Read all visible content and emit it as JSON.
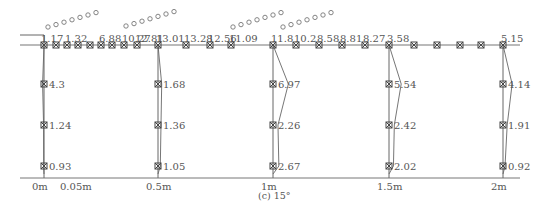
{
  "caption": "(c) 15°",
  "x_axis": {
    "ticks": [
      {
        "label": "0m",
        "x": 44
      },
      {
        "label": "0.05m",
        "x": 72
      },
      {
        "label": "0.5m",
        "x": 158
      },
      {
        "label": "1m",
        "x": 273
      },
      {
        "label": "1.5m",
        "x": 389
      },
      {
        "label": "2m",
        "x": 503
      }
    ]
  },
  "bed_line_y": 45,
  "baseline_y": 178,
  "surface_points": [
    {
      "x": 44,
      "label": "1.17"
    },
    {
      "x": 56,
      "label": ""
    },
    {
      "x": 67,
      "label": "1.32"
    },
    {
      "x": 78,
      "label": ""
    },
    {
      "x": 90,
      "label": ""
    },
    {
      "x": 101,
      "label": "6.88"
    },
    {
      "x": 112,
      "label": ""
    },
    {
      "x": 124,
      "label": "10.27"
    },
    {
      "x": 137,
      "label": "12.81"
    },
    {
      "x": 158,
      "label": "13.01"
    },
    {
      "x": 186,
      "label": "13.28"
    },
    {
      "x": 210,
      "label": "12.56"
    },
    {
      "x": 231,
      "label": "11.09"
    },
    {
      "x": 273,
      "label": "11.8"
    },
    {
      "x": 296,
      "label": "10.2"
    },
    {
      "x": 319,
      "label": "8.58"
    },
    {
      "x": 342,
      "label": "8.81"
    },
    {
      "x": 365,
      "label": "8.27"
    },
    {
      "x": 389,
      "label": "3.58"
    },
    {
      "x": 414,
      "label": ""
    },
    {
      "x": 437,
      "label": ""
    },
    {
      "x": 460,
      "label": ""
    },
    {
      "x": 481,
      "label": ""
    },
    {
      "x": 503,
      "label": "5.15"
    }
  ],
  "verticals": [
    {
      "name": "0m",
      "x": 44,
      "points": [
        {
          "y": 84,
          "label": "4.3"
        },
        {
          "y": 125,
          "label": "1.24"
        },
        {
          "y": 166,
          "label": "0.93"
        }
      ]
    },
    {
      "name": "0.5m",
      "x": 158,
      "points": [
        {
          "y": 84,
          "label": "1.68"
        },
        {
          "y": 125,
          "label": "1.36"
        },
        {
          "y": 166,
          "label": "1.05"
        }
      ]
    },
    {
      "name": "1m",
      "x": 273,
      "points": [
        {
          "y": 84,
          "label": "6.97"
        },
        {
          "y": 125,
          "label": "2.26"
        },
        {
          "y": 166,
          "label": "2.67"
        }
      ]
    },
    {
      "name": "1.5m",
      "x": 389,
      "points": [
        {
          "y": 84,
          "label": "5.54"
        },
        {
          "y": 125,
          "label": "2.42"
        },
        {
          "y": 166,
          "label": "2.02"
        }
      ]
    },
    {
      "name": "2m",
      "x": 503,
      "points": [
        {
          "y": 84,
          "label": "4.14"
        },
        {
          "y": 125,
          "label": "1.91"
        },
        {
          "y": 166,
          "label": "0.92"
        }
      ]
    }
  ],
  "bubble_groups": [
    {
      "x0": 48,
      "y0": 33,
      "dx": 8,
      "dy": -2.4,
      "count": 7
    },
    {
      "x0": 126,
      "y0": 32,
      "dx": 8,
      "dy": -2.4,
      "count": 7
    },
    {
      "x0": 233,
      "y0": 33,
      "dx": 8,
      "dy": -2.4,
      "count": 7
    },
    {
      "x0": 283,
      "y0": 33,
      "dx": 8,
      "dy": -2.4,
      "count": 7
    }
  ],
  "colors": {
    "line": "#666666",
    "marker": "#444444",
    "text": "#555555",
    "bubble": "#777777"
  }
}
